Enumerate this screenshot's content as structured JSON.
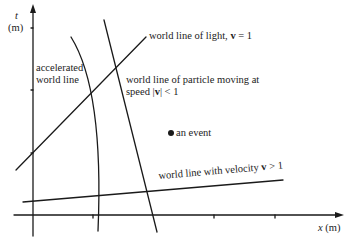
{
  "axes": {
    "y_label": "t",
    "y_unit": "(m)",
    "x_label": "x",
    "x_unit": "(m)"
  },
  "labels": {
    "accelerated_line1": "accelerated",
    "accelerated_line2": "world line",
    "light": "world line of light, ",
    "light_v": "v",
    "light_eq": " = 1",
    "particle_line1": "world line of particle moving at",
    "particle_speed": "speed |",
    "particle_v": "v",
    "particle_lt": "| < 1",
    "event": "an event",
    "superluminal": "world line with velocity ",
    "superluminal_v": "v",
    "superluminal_gt": " > 1"
  },
  "colors": {
    "ink": "#1a1a1a",
    "background": "#ffffff"
  }
}
